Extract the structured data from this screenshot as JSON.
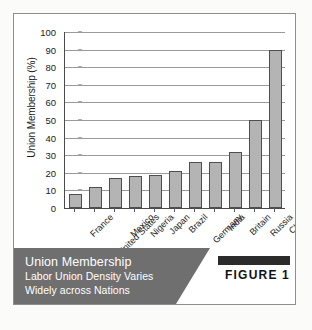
{
  "figure": {
    "badge_label": "FIGURE 1",
    "caption_title": "Union Membership",
    "caption_line2": "Labor Union Density Varies",
    "caption_line3": "Widely across Nations",
    "banner_color": "#6f6f6f",
    "badge_bar_color": "#2b2b2b"
  },
  "chart_data": {
    "type": "bar",
    "title": "Union Membership",
    "subtitle": "Labor Union Density Varies Widely across Nations",
    "xlabel": "",
    "ylabel": "Union Membership (%)",
    "categories": [
      "France",
      "United States",
      "Mexico",
      "Nigeria",
      "Japan",
      "Brazil",
      "Germany",
      "India",
      "Britain",
      "Russia",
      "China"
    ],
    "values": [
      8,
      12,
      17,
      18,
      19,
      21,
      26,
      26,
      32,
      50,
      90
    ],
    "ylim": [
      0,
      100
    ],
    "yticks": [
      0,
      10,
      20,
      30,
      40,
      50,
      60,
      70,
      80,
      90,
      100
    ],
    "ytick_labels": [
      "0",
      "10",
      "20",
      "30",
      "40",
      "50",
      "60",
      "70",
      "80",
      "90",
      "100"
    ],
    "grid": true,
    "legend": false,
    "bar_color": "#b4b4b4",
    "bar_edge_color": "#4f4f4f",
    "gridline_color": "#9a9a9a"
  }
}
